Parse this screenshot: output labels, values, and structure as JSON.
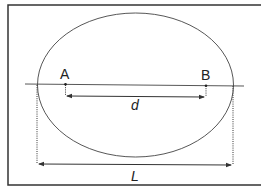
{
  "diagram": {
    "points": [
      {
        "id": "A",
        "label": "A"
      },
      {
        "id": "B",
        "label": "B"
      }
    ],
    "dimensions": [
      {
        "id": "d",
        "label": "d",
        "from": "A",
        "to": "B",
        "description": "distance between A and B"
      },
      {
        "id": "L",
        "label": "L",
        "description": "width of ellipse along the line"
      }
    ],
    "colors": {
      "stroke": "#3a3a3a",
      "frame": "#333333",
      "background": "#ffffff"
    }
  }
}
